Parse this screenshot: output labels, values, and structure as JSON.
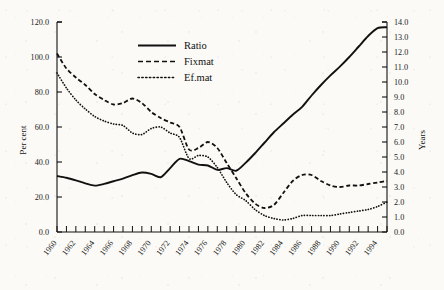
{
  "chart_data": {
    "type": "line",
    "title": "",
    "subtitle": "",
    "xlabel": "",
    "ylabel": "Per cent",
    "y2label": "Years",
    "grid": false,
    "legend_position": "top-center",
    "xlim": [
      1960,
      1995
    ],
    "ylim": [
      0.0,
      120.0
    ],
    "y2lim": [
      0.0,
      14.0
    ],
    "x_tick_interval": 1,
    "x_label_interval": 2,
    "x_tick_labels": [
      "1960",
      "1962",
      "1964",
      "1966",
      "1968",
      "1970",
      "1972",
      "1974",
      "1976",
      "1978",
      "1980",
      "1982",
      "1984",
      "1986",
      "1988",
      "1990",
      "1992",
      "1994"
    ],
    "y_tick_labels": [
      "0.0",
      "20.0",
      "40.0",
      "60.0",
      "80.0",
      "100.0",
      "120.0"
    ],
    "y2_tick_labels": [
      "0.0",
      "1.0",
      "2.0",
      "3.0",
      "4.0",
      "5.0",
      "6.0",
      "7.0",
      "8.0",
      "9.0",
      "10.0",
      "11.0",
      "12.0",
      "13.0",
      "14.0"
    ],
    "x": [
      1960,
      1961,
      1962,
      1963,
      1964,
      1965,
      1966,
      1967,
      1968,
      1969,
      1970,
      1971,
      1972,
      1973,
      1974,
      1975,
      1976,
      1977,
      1978,
      1979,
      1980,
      1981,
      1982,
      1983,
      1984,
      1985,
      1986,
      1987,
      1988,
      1989,
      1990,
      1991,
      1992,
      1993,
      1994,
      1995
    ],
    "series": [
      {
        "name": "Ratio",
        "axis": "left",
        "style": "solid",
        "values": [
          32.0,
          31.0,
          29.5,
          27.8,
          26.5,
          27.5,
          29.0,
          30.5,
          32.5,
          34.0,
          33.2,
          31.3,
          36.5,
          41.8,
          40.5,
          38.5,
          38.0,
          35.5,
          36.5,
          35.0,
          39.5,
          45.0,
          51.0,
          57.0,
          62.0,
          67.0,
          71.5,
          78.0,
          84.0,
          89.5,
          94.5,
          100.0,
          106.0,
          112.0,
          116.5,
          117.0
        ]
      },
      {
        "name": "Fixmat",
        "axis": "right",
        "style": "dashed",
        "values": [
          11.9,
          10.9,
          10.3,
          9.8,
          9.2,
          8.8,
          8.5,
          8.6,
          8.9,
          8.6,
          8.0,
          7.6,
          7.3,
          7.0,
          5.5,
          5.6,
          6.0,
          5.6,
          4.6,
          3.6,
          2.6,
          1.9,
          1.6,
          1.8,
          2.6,
          3.4,
          3.8,
          3.8,
          3.4,
          3.1,
          3.0,
          3.1,
          3.1,
          3.2,
          3.3,
          3.4
        ]
      },
      {
        "name": "Ef.mat",
        "axis": "right",
        "style": "dotted",
        "values": [
          10.6,
          9.6,
          8.8,
          8.2,
          7.7,
          7.4,
          7.2,
          7.1,
          6.6,
          6.5,
          6.9,
          7.0,
          6.6,
          6.3,
          4.9,
          5.1,
          5.0,
          4.3,
          3.3,
          2.5,
          2.1,
          1.5,
          1.1,
          0.9,
          0.8,
          0.9,
          1.1,
          1.1,
          1.1,
          1.1,
          1.2,
          1.3,
          1.4,
          1.5,
          1.7,
          2.0
        ]
      }
    ]
  },
  "legend": {
    "items": [
      {
        "label": "Ratio",
        "style": "solid"
      },
      {
        "label": "Fixmat",
        "style": "dashed"
      },
      {
        "label": "Ef.mat",
        "style": "dotted"
      }
    ]
  },
  "axes": {
    "left_title": "Per cent",
    "right_title": "Years"
  },
  "colors": {
    "ink": "#111111",
    "paper": "#fbfaf7"
  }
}
